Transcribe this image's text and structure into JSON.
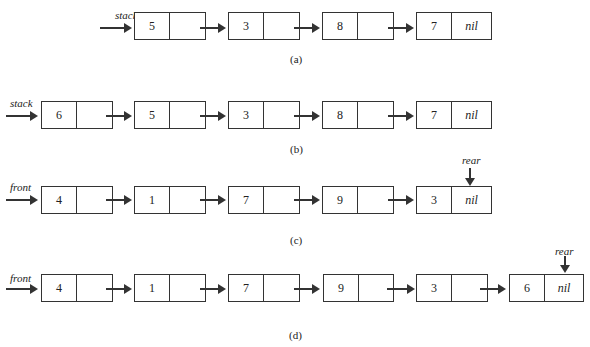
{
  "diagrams": [
    {
      "id": "a",
      "pointer_label": "stack",
      "caption": "(a)",
      "nodes": [
        {
          "value": "5",
          "next": ""
        },
        {
          "value": "3",
          "next": ""
        },
        {
          "value": "8",
          "next": ""
        },
        {
          "value": "7",
          "next": "nil"
        }
      ]
    },
    {
      "id": "b",
      "pointer_label": "stack",
      "caption": "(b)",
      "nodes": [
        {
          "value": "6",
          "next": ""
        },
        {
          "value": "5",
          "next": ""
        },
        {
          "value": "3",
          "next": ""
        },
        {
          "value": "8",
          "next": ""
        },
        {
          "value": "7",
          "next": "nil"
        }
      ]
    },
    {
      "id": "c",
      "pointer_label": "front",
      "rear_label": "rear",
      "caption": "(c)",
      "nodes": [
        {
          "value": "4",
          "next": ""
        },
        {
          "value": "1",
          "next": ""
        },
        {
          "value": "7",
          "next": ""
        },
        {
          "value": "9",
          "next": ""
        },
        {
          "value": "3",
          "next": "nil"
        }
      ]
    },
    {
      "id": "d",
      "pointer_label": "front",
      "rear_label": "rear",
      "caption": "(d)",
      "nodes": [
        {
          "value": "4",
          "next": ""
        },
        {
          "value": "1",
          "next": ""
        },
        {
          "value": "7",
          "next": ""
        },
        {
          "value": "9",
          "next": ""
        },
        {
          "value": "3",
          "next": ""
        },
        {
          "value": "6",
          "next": "nil"
        }
      ]
    }
  ]
}
